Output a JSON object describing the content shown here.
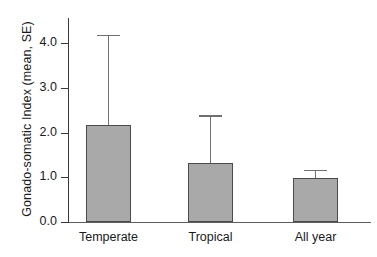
{
  "chart_data": {
    "type": "bar",
    "title": "",
    "xlabel": "",
    "ylabel": "Gonado-somatic Index (mean, SE)",
    "categories": [
      "Temperate",
      "Tropical",
      "All year"
    ],
    "values": [
      2.16,
      1.31,
      0.99
    ],
    "errors_upper": [
      4.17,
      2.38,
      1.17
    ],
    "series": [
      {
        "name": "Gonado-somatic Index",
        "values": [
          2.16,
          1.31,
          0.99
        ],
        "error_upper": [
          4.17,
          2.38,
          1.17
        ]
      }
    ],
    "ylim": [
      0.0,
      4.5
    ],
    "yticks": [
      0.0,
      1.0,
      2.0,
      3.0,
      4.0
    ],
    "ytick_labels": [
      "0.0",
      "1.0",
      "2.0",
      "3.0",
      "4.0"
    ],
    "grid": false,
    "legend": false,
    "legend_position": "none",
    "error_type": "SE (upper whisker only)",
    "colors": {
      "bar_fill": "#a9a9a9",
      "bar_edge": "#4a4a4a",
      "error_bar": "#707070",
      "axis": "#3a3a3a",
      "text": "#1a1a1a",
      "background": "#ffffff"
    }
  }
}
